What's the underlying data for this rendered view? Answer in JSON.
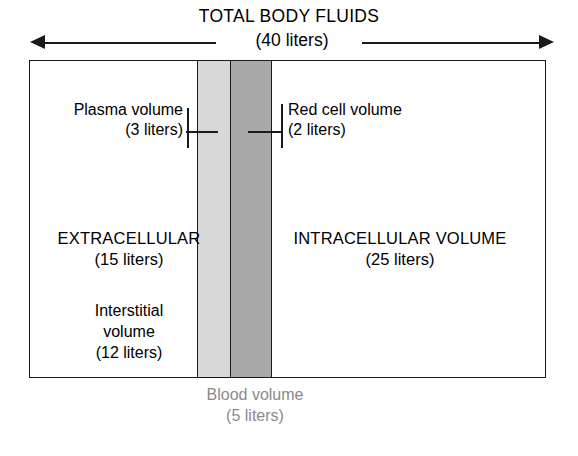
{
  "figure": {
    "title": "TOTAL BODY FLUIDS",
    "total_value": "(40 liters)"
  },
  "callouts": {
    "plasma": {
      "name": "Plasma volume",
      "value": "(3 liters)"
    },
    "red_cell": {
      "name": "Red cell volume",
      "value": "(2 liters)"
    }
  },
  "compartments": {
    "extracellular": {
      "name": "EXTRACELLULAR",
      "value": "(15 liters)"
    },
    "intracellular": {
      "name": "INTRACELLULAR VOLUME",
      "value": "(25 liters)"
    },
    "interstitial": {
      "name_line1": "Interstitial",
      "name_line2": "volume",
      "value": "(12 liters)"
    }
  },
  "blood_volume": {
    "name": "Blood volume",
    "value": "(5 liters)"
  },
  "colors": {
    "plasma_band": "#d8d8d8",
    "red_cell_band": "#a9a9a9",
    "outline": "#1a1a1a",
    "blood_caption_text": "#8a8a8a",
    "background": "#ffffff"
  },
  "chart_data": {
    "type": "bar",
    "title": "TOTAL BODY FLUIDS",
    "subtitle": "(40 liters)",
    "orientation": "horizontal-stacked",
    "units": "liters",
    "total": 40,
    "xlabel": "",
    "ylabel": "",
    "grid": false,
    "legend": "none",
    "categories": [
      "Interstitial volume",
      "Plasma volume",
      "Red cell volume",
      "Intracellular volume"
    ],
    "values": [
      12,
      3,
      2,
      25
    ],
    "series": [
      {
        "name": "Body fluid compartments",
        "values": [
          12,
          3,
          2,
          25
        ]
      }
    ],
    "segments": [
      {
        "label": "Interstitial volume",
        "value": 12,
        "fill": "#ffffff",
        "group": "EXTRACELLULAR"
      },
      {
        "label": "Plasma volume",
        "value": 3,
        "fill": "#d8d8d8",
        "group": "EXTRACELLULAR"
      },
      {
        "label": "Red cell volume",
        "value": 2,
        "fill": "#a9a9a9",
        "group": "INTRACELLULAR VOLUME"
      },
      {
        "label": "Intracellular volume",
        "value": 25,
        "fill": "#ffffff",
        "group": "INTRACELLULAR VOLUME"
      }
    ],
    "groups": [
      {
        "name": "EXTRACELLULAR",
        "value": 15,
        "label": "(15 liters)"
      },
      {
        "name": "INTRACELLULAR VOLUME",
        "value": 25,
        "label": "(25 liters)"
      }
    ],
    "annotations": [
      {
        "text": "Blood volume",
        "value": 5,
        "label": "(5 liters)",
        "spans": [
          "Plasma volume",
          "Red cell volume"
        ]
      }
    ],
    "xlim": [
      0,
      40
    ]
  }
}
